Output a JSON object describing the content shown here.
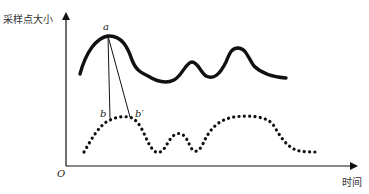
{
  "axes": {
    "y_label": "采样点大小",
    "x_label": "时间",
    "origin_label": "O"
  },
  "points": {
    "a": "a",
    "b": "b",
    "b_prime": "b′"
  },
  "colors": {
    "stroke": "#111111",
    "background": "#ffffff"
  },
  "curves": [
    {
      "name": "original-signal",
      "style": "solid"
    },
    {
      "name": "sampled-signal",
      "style": "dotted"
    }
  ]
}
